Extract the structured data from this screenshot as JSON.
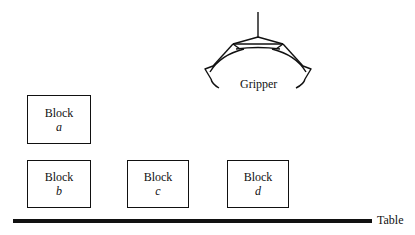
{
  "diagram": {
    "type": "blocks-world",
    "gripper": {
      "label": "Gripper"
    },
    "table": {
      "label": "Table"
    },
    "blocks": [
      {
        "id": "a",
        "word": "Block",
        "letter": "a",
        "on": "b"
      },
      {
        "id": "b",
        "word": "Block",
        "letter": "b",
        "on": "Table"
      },
      {
        "id": "c",
        "word": "Block",
        "letter": "c",
        "on": "Table"
      },
      {
        "id": "d",
        "word": "Block",
        "letter": "d",
        "on": "Table"
      }
    ],
    "colors": {
      "ink": "#111111",
      "background": "#ffffff"
    }
  }
}
